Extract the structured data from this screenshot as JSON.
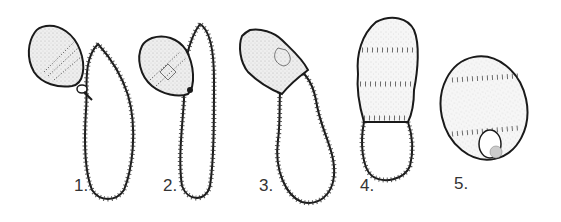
{
  "figure": {
    "panels": [
      {
        "label": "1.",
        "x": 74,
        "y": 176
      },
      {
        "label": "2.",
        "x": 163,
        "y": 176
      },
      {
        "label": "3.",
        "x": 259,
        "y": 176
      },
      {
        "label": "4.",
        "x": 360,
        "y": 176
      },
      {
        "label": "5.",
        "x": 454,
        "y": 174
      }
    ],
    "colors": {
      "ink": "#1a1a1a",
      "stipple": "#d8d8d8",
      "background": "#ffffff"
    }
  }
}
